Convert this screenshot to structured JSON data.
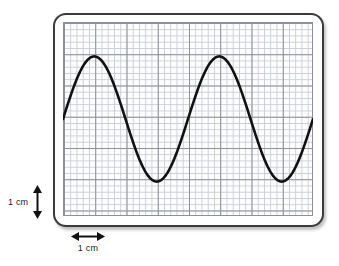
{
  "figure": {
    "name": "oscilloscope-waveform-on-graph-paper",
    "background_color": "#ffffff"
  },
  "bezel": {
    "name": "screen-bezel",
    "border_color": "#3b3b3b",
    "corner_radius_px": 13
  },
  "grid": {
    "name": "graph-paper-grid",
    "minor_color": "#c9cdd6",
    "major_color": "#8d8f99",
    "minor_spacing_px": 6.25,
    "major_spacing_px": 31.25,
    "minor_per_major": 5,
    "columns_major": 8,
    "rows_major": 6,
    "width_px": 250,
    "height_px": 194
  },
  "annotations": {
    "vertical_scale": {
      "label": "1 cm",
      "arrow": "double-headed-vertical-arrow",
      "measures": "one major square height"
    },
    "horizontal_scale": {
      "label": "1 cm",
      "arrow": "double-headed-horizontal-arrow",
      "measures": "one major square width"
    }
  },
  "chart_data": {
    "type": "line",
    "title": "",
    "xlabel": "",
    "ylabel": "",
    "grid": true,
    "legend": false,
    "trace_color": "#111111",
    "trace_width_px": 2.6,
    "units": "cm",
    "xlim": [
      0,
      8
    ],
    "ylim": [
      0,
      6.2
    ],
    "wave": {
      "shape": "sine",
      "amplitude_cm": 2.0,
      "wavelength_cm": 4.0,
      "midline_y_cm": 3.1,
      "cycles_shown": 2,
      "peak_y_cm": 5.1,
      "trough_y_cm": 1.1,
      "start_phase_deg": 0
    },
    "annotated_points": [
      {
        "name": "wave-start",
        "x": 0.0,
        "y": 3.1
      },
      {
        "name": "peak-1",
        "x": 1.0,
        "y": 5.1
      },
      {
        "name": "zero-crossing-falling-1",
        "x": 2.0,
        "y": 3.1
      },
      {
        "name": "trough-1",
        "x": 3.0,
        "y": 1.1
      },
      {
        "name": "zero-crossing-rising-1",
        "x": 4.0,
        "y": 3.1
      },
      {
        "name": "peak-2",
        "x": 5.0,
        "y": 5.1
      },
      {
        "name": "zero-crossing-falling-2",
        "x": 6.0,
        "y": 3.1
      },
      {
        "name": "trough-2",
        "x": 7.0,
        "y": 1.1
      },
      {
        "name": "wave-end",
        "x": 8.0,
        "y": 3.1
      }
    ],
    "x": [
      0,
      0.25,
      0.5,
      0.75,
      1,
      1.25,
      1.5,
      1.75,
      2,
      2.25,
      2.5,
      2.75,
      3,
      3.25,
      3.5,
      3.75,
      4,
      4.25,
      4.5,
      4.75,
      5,
      5.25,
      5.5,
      5.75,
      6,
      6.25,
      6.5,
      6.75,
      7,
      7.25,
      7.5,
      7.75,
      8
    ],
    "y": [
      3.1,
      3.87,
      4.51,
      4.93,
      5.1,
      4.93,
      4.51,
      3.87,
      3.1,
      2.33,
      1.69,
      1.27,
      1.1,
      1.27,
      1.69,
      2.33,
      3.1,
      3.87,
      4.51,
      4.93,
      5.1,
      4.93,
      4.51,
      3.87,
      3.1,
      2.33,
      1.69,
      1.27,
      1.1,
      1.27,
      1.69,
      2.33,
      3.1
    ]
  }
}
